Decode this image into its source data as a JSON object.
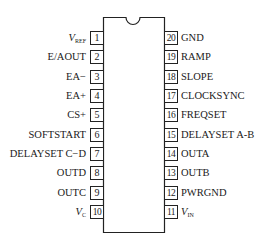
{
  "chip": {
    "package": "20-pin DIP",
    "pin_count": 20,
    "colors": {
      "line": "#222222",
      "text": "#1a1a1a",
      "background": "#ffffff"
    }
  },
  "left_pins": [
    {
      "number": "1",
      "name_main": "V",
      "name_sub": "REF",
      "italic": true
    },
    {
      "number": "2",
      "name": "E/AOUT"
    },
    {
      "number": "3",
      "name": "EA−"
    },
    {
      "number": "4",
      "name": "EA+"
    },
    {
      "number": "5",
      "name": "CS+"
    },
    {
      "number": "6",
      "name": "SOFTSTART"
    },
    {
      "number": "7",
      "name": "DELAYSET C−D"
    },
    {
      "number": "8",
      "name": "OUTD"
    },
    {
      "number": "9",
      "name": "OUTC"
    },
    {
      "number": "10",
      "name_main": "V",
      "name_sub": "C",
      "italic": true
    }
  ],
  "right_pins": [
    {
      "number": "20",
      "name": "GND"
    },
    {
      "number": "19",
      "name": "RAMP"
    },
    {
      "number": "18",
      "name": "SLOPE"
    },
    {
      "number": "17",
      "name": "CLOCKSYNC"
    },
    {
      "number": "16",
      "name": "FREQSET"
    },
    {
      "number": "15",
      "name": "DELAYSET A-B"
    },
    {
      "number": "14",
      "name": "OUTA"
    },
    {
      "number": "13",
      "name": "OUTB"
    },
    {
      "number": "12",
      "name": "PWRGND"
    },
    {
      "number": "11",
      "name_main": "V",
      "name_sub": "IN",
      "italic": true
    }
  ]
}
